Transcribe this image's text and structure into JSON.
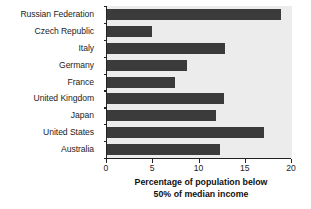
{
  "chart_data": {
    "type": "bar",
    "orientation": "horizontal",
    "title": "",
    "xlabel": "Percentage of population below 50% of median income",
    "xlabel_lines": [
      "Percentage of population below",
      "50% of median income"
    ],
    "ylabel": "",
    "categories": [
      "Russian Federation",
      "Czech Republic",
      "Italy",
      "Germany",
      "France",
      "United Kingdom",
      "Japan",
      "United States",
      "Australia"
    ],
    "values": [
      18.8,
      4.9,
      12.8,
      8.6,
      7.4,
      12.6,
      11.8,
      17.0,
      12.2
    ],
    "xlim": [
      0,
      20
    ],
    "xticks": [
      0,
      5,
      10,
      15,
      20
    ],
    "xtick_labels": [
      "0",
      "5",
      "10",
      "15",
      "20"
    ],
    "grid": false,
    "legend": null,
    "colors": {
      "bar": "#3b3b3b",
      "plot_background": "#ececec",
      "page_background": "#ffffff",
      "axis": "#222222",
      "text": "#1c1c1c"
    }
  }
}
